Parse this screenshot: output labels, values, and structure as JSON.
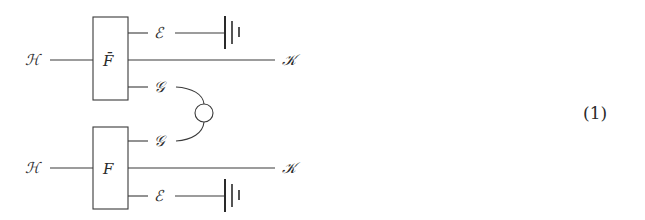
{
  "diagram": {
    "equation_number": "(1)",
    "top_block": {
      "box_label": "F̄",
      "input_label": "ℋ",
      "output_label": "𝒦",
      "ancilla_top_label": "ℰ",
      "ancilla_bottom_label": "𝒢"
    },
    "bottom_block": {
      "box_label": "F",
      "input_label": "ℋ",
      "output_label": "𝒦",
      "ancilla_top_label": "𝒢",
      "ancilla_bottom_label": "ℰ"
    },
    "connector": "circle",
    "terminations": [
      "ground",
      "ground"
    ]
  }
}
